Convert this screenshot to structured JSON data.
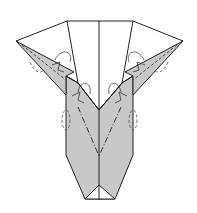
{
  "diagram": {
    "colors": {
      "paper_white": "#ffffff",
      "paper_gray": "#c8c8c8",
      "line": "#222222",
      "dash": "#444444"
    },
    "annotations": {
      "left_wing": "valley-fold arrows on left point",
      "right_wing": "valley-fold arrows on right point",
      "center": "mountain/valley fold lines converging at center",
      "sides": "dashed circle arrows indicating fold behind"
    }
  }
}
